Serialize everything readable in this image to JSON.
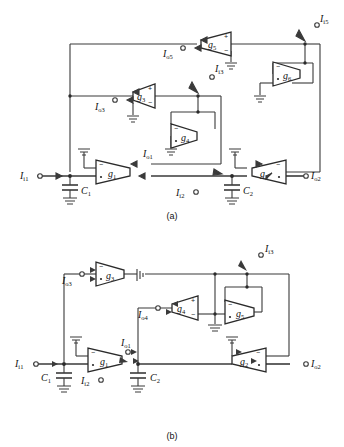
{
  "document": {
    "kind": "circuit-schematic-figure",
    "description": "Two OTA-C (transconductance-capacitor) filter circuit schematics labelled (a) and (b)."
  },
  "figures": [
    {
      "id": "a",
      "caption": "(a)",
      "amplifiers": [
        {
          "name": "g",
          "sub": "1",
          "orientation": "right"
        },
        {
          "name": "g",
          "sub": "2",
          "orientation": "left"
        },
        {
          "name": "g",
          "sub": "3",
          "orientation": "left"
        },
        {
          "name": "g",
          "sub": "4",
          "orientation": "right"
        },
        {
          "name": "g",
          "sub": "5",
          "orientation": "left"
        },
        {
          "name": "g",
          "sub": "6",
          "orientation": "right"
        }
      ],
      "capacitors": [
        {
          "name": "C",
          "sub": "1"
        },
        {
          "name": "C",
          "sub": "2"
        }
      ],
      "ports": [
        {
          "name": "I",
          "sub": "i1",
          "kind": "input"
        },
        {
          "name": "I",
          "sub": "i2",
          "kind": "input"
        },
        {
          "name": "I",
          "sub": "i3",
          "kind": "input"
        },
        {
          "name": "I",
          "sub": "i5",
          "kind": "input"
        },
        {
          "name": "I",
          "sub": "o1",
          "kind": "output"
        },
        {
          "name": "I",
          "sub": "o2",
          "kind": "output"
        },
        {
          "name": "I",
          "sub": "o3",
          "kind": "output"
        },
        {
          "name": "I",
          "sub": "o5",
          "kind": "output"
        }
      ]
    },
    {
      "id": "b",
      "caption": "(b)",
      "amplifiers": [
        {
          "name": "g",
          "sub": "1",
          "orientation": "right"
        },
        {
          "name": "g",
          "sub": "2",
          "orientation": "left"
        },
        {
          "name": "g",
          "sub": "3",
          "orientation": "right"
        },
        {
          "name": "g",
          "sub": "4",
          "orientation": "left"
        },
        {
          "name": "g",
          "sub": "5",
          "orientation": "right"
        }
      ],
      "capacitors": [
        {
          "name": "C",
          "sub": "1"
        },
        {
          "name": "C",
          "sub": "2"
        }
      ],
      "ports": [
        {
          "name": "I",
          "sub": "i1",
          "kind": "input"
        },
        {
          "name": "I",
          "sub": "i2",
          "kind": "input"
        },
        {
          "name": "I",
          "sub": "i3",
          "kind": "input"
        },
        {
          "name": "I",
          "sub": "o1",
          "kind": "output"
        },
        {
          "name": "I",
          "sub": "o2",
          "kind": "output"
        },
        {
          "name": "I",
          "sub": "o3",
          "kind": "output"
        },
        {
          "name": "I",
          "sub": "o4",
          "kind": "output"
        }
      ]
    }
  ],
  "polarity": {
    "plus": "+",
    "minus": "−"
  },
  "colors": {
    "ink": "#2b2b2b",
    "wire": "#3a3a3a",
    "background": "#ffffff"
  }
}
